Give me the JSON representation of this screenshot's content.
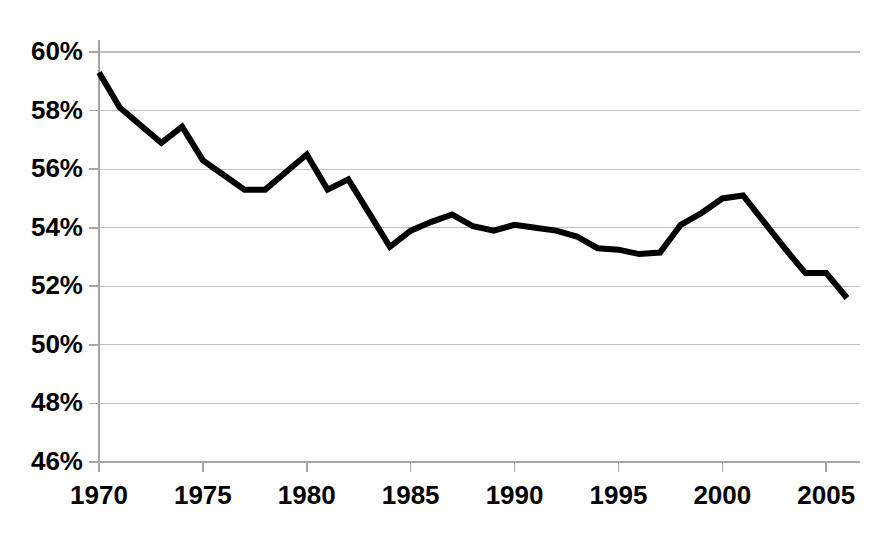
{
  "chart_data": {
    "type": "line",
    "title": "",
    "subtitle": "",
    "xlabel": "",
    "ylabel": "",
    "xlim": [
      1970,
      2006
    ],
    "ylim": [
      46,
      60
    ],
    "ytick_values": [
      60,
      58,
      56,
      54,
      52,
      50,
      48,
      46
    ],
    "ytick_labels": [
      "60%",
      "58%",
      "56%",
      "54%",
      "52%",
      "50%",
      "48%",
      "46%"
    ],
    "xtick_values": [
      1970,
      1975,
      1980,
      1985,
      1990,
      1995,
      2000,
      2005
    ],
    "xtick_labels": [
      "1970",
      "1975",
      "1980",
      "1985",
      "1990",
      "1995",
      "2000",
      "2005"
    ],
    "grid": true,
    "grid_axis": "y",
    "legend": false,
    "legend_position": "none",
    "line_color": "#000000",
    "line_width_px": 6,
    "grid_color": "#bfbfbf",
    "axis_color": "#a6a6a6",
    "background_color": "#ffffff",
    "x": [
      1970,
      1971,
      1972,
      1973,
      1974,
      1975,
      1976,
      1977,
      1978,
      1979,
      1980,
      1981,
      1982,
      1983,
      1984,
      1985,
      1986,
      1987,
      1988,
      1989,
      1990,
      1991,
      1992,
      1993,
      1994,
      1995,
      1996,
      1997,
      1998,
      1999,
      2000,
      2001,
      2002,
      2003,
      2004,
      2005,
      2006
    ],
    "values": [
      59.3,
      58.1,
      57.5,
      56.9,
      57.45,
      56.3,
      55.8,
      55.3,
      55.3,
      55.9,
      56.5,
      55.3,
      55.65,
      54.5,
      53.35,
      53.9,
      54.2,
      54.45,
      54.05,
      53.9,
      54.1,
      54.0,
      53.9,
      53.7,
      53.3,
      53.25,
      53.1,
      53.15,
      54.1,
      54.5,
      55.0,
      55.1,
      54.2,
      53.3,
      52.45,
      52.45,
      51.6
    ],
    "series": [
      {
        "name": "",
        "values": [
          59.3,
          58.1,
          57.5,
          56.9,
          57.45,
          56.3,
          55.8,
          55.3,
          55.3,
          55.9,
          56.5,
          55.3,
          55.65,
          54.5,
          53.35,
          53.9,
          54.2,
          54.45,
          54.05,
          53.9,
          54.1,
          54.0,
          53.9,
          53.7,
          53.3,
          53.25,
          53.1,
          53.15,
          54.1,
          54.5,
          55.0,
          55.1,
          54.2,
          53.3,
          52.45,
          52.45,
          51.6
        ]
      }
    ],
    "annotations": []
  }
}
